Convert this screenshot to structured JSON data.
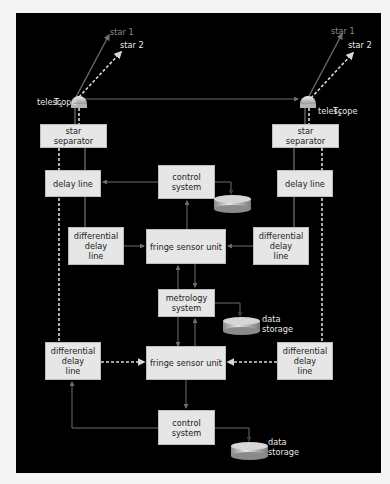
{
  "diagram": {
    "colors": {
      "background": "#000000",
      "box_fill": "#e6e6e6",
      "line": "#6e6e6e",
      "dashed_line": "#d8d8d8",
      "text_light": "#e8e8e8",
      "star1_label": "#8a8a8a"
    },
    "telescopes": [
      {
        "label": "telescope",
        "subscript": "1",
        "symbol": "T"
      },
      {
        "label": "telescope",
        "subscript": "2",
        "symbol": "T"
      }
    ],
    "stars": {
      "star1": "star 1",
      "star2": "star 2"
    },
    "boxes": {
      "star_separator_left": "star\nseparator",
      "star_separator_right": "star\nseparator",
      "delay_line_left": "delay line",
      "delay_line_right": "delay line",
      "control_system_top": "control\nsystem",
      "diff_delay_left_top": "differential\ndelay\nline",
      "diff_delay_right_top": "differential\ndelay\nline",
      "fringe_sensor_top": "fringe sensor unit",
      "metrology_system": "metrology\nsystem",
      "diff_delay_left_bottom": "differential\ndelay\nline",
      "diff_delay_right_bottom": "differential\ndelay\nline",
      "fringe_sensor_bottom": "fringe sensor unit",
      "control_system_bottom": "control\nsystem"
    },
    "storage_labels": {
      "metrology_storage": "data\nstorage",
      "bottom_storage": "data\nstorage"
    },
    "legend_meaning": {
      "solid": "star 1 light path",
      "dashed": "star 2 light path"
    }
  }
}
